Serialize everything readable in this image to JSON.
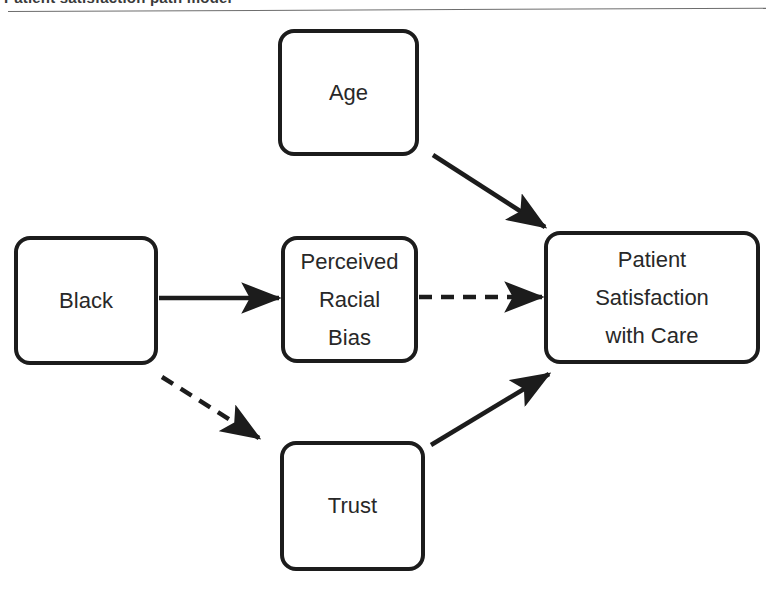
{
  "figure": {
    "caption_clipped": "Patient satisfaction path model",
    "divider": "horizontal-rule"
  },
  "diagram": {
    "type": "path-diagram",
    "nodes": [
      {
        "id": "age",
        "label": "Age",
        "shape": "rounded-rect"
      },
      {
        "id": "black",
        "label": "Black",
        "shape": "rounded-rect"
      },
      {
        "id": "bias",
        "label": "Perceived\nRacial\nBias",
        "shape": "rounded-rect"
      },
      {
        "id": "outcome",
        "label": "Patient\nSatisfaction\nwith Care",
        "shape": "rounded-rect"
      },
      {
        "id": "trust",
        "label": "Trust",
        "shape": "rounded-rect"
      }
    ],
    "edges": [
      {
        "id": "age-to-outcome",
        "from": "age",
        "to": "outcome",
        "style": "solid",
        "arrow": "single"
      },
      {
        "id": "black-to-bias",
        "from": "black",
        "to": "bias",
        "style": "solid",
        "arrow": "single"
      },
      {
        "id": "bias-to-outcome",
        "from": "bias",
        "to": "outcome",
        "style": "dashed",
        "arrow": "single"
      },
      {
        "id": "black-to-trust",
        "from": "black",
        "to": "trust",
        "style": "dashed",
        "arrow": "single"
      },
      {
        "id": "trust-to-outcome",
        "from": "trust",
        "to": "outcome",
        "style": "solid",
        "arrow": "single"
      }
    ],
    "colors": {
      "stroke": "#1c1c1c",
      "text": "#282828",
      "background": "#ffffff",
      "rule": "#6d6d6d"
    }
  }
}
